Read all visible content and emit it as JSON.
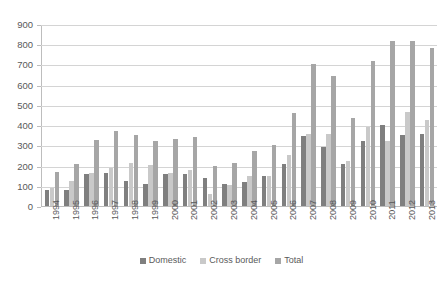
{
  "chart_data": {
    "type": "bar",
    "title": "",
    "subtitle": "",
    "xlabel": "",
    "ylabel": "",
    "ylim": [
      0,
      900
    ],
    "ytick_step": 100,
    "yticks": [
      0,
      100,
      200,
      300,
      400,
      500,
      600,
      700,
      800,
      900
    ],
    "grid": true,
    "legend_position": "bottom",
    "categories": [
      "1994",
      "1995",
      "1996",
      "1997",
      "1998",
      "1999",
      "2000",
      "2001",
      "2002",
      "2003",
      "2004",
      "2005",
      "2006",
      "2007",
      "2008",
      "2009",
      "2010",
      "2011",
      "2012",
      "2013"
    ],
    "series": [
      {
        "name": "Domestic",
        "color": "#7f7f7f",
        "values": [
          80,
          80,
          160,
          165,
          125,
          110,
          160,
          160,
          140,
          110,
          120,
          150,
          210,
          345,
          290,
          210,
          320,
          400,
          350,
          355
        ]
      },
      {
        "name": "Cross border",
        "color": "#c9c9c9",
        "values": [
          90,
          125,
          165,
          190,
          215,
          205,
          165,
          180,
          60,
          105,
          150,
          150,
          250,
          355,
          355,
          225,
          390,
          320,
          465,
          425
        ]
      },
      {
        "name": "Total",
        "color": "#a6a6a6",
        "values": [
          170,
          210,
          325,
          370,
          350,
          320,
          330,
          340,
          200,
          215,
          270,
          300,
          460,
          700,
          645,
          435,
          715,
          815,
          815,
          780
        ]
      }
    ],
    "legend": [
      "Domestic",
      "Cross border",
      "Total"
    ],
    "caption": ""
  },
  "legend": {
    "items": [
      {
        "label": "Domestic",
        "key": "domestic"
      },
      {
        "label": "Cross border",
        "key": "cross"
      },
      {
        "label": "Total",
        "key": "total"
      }
    ]
  },
  "caption": {
    "text": ""
  }
}
